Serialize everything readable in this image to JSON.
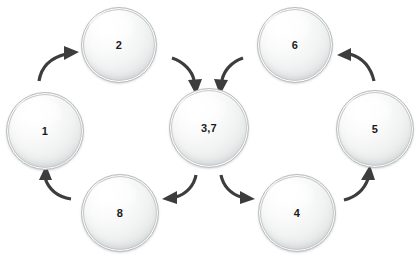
{
  "diagram": {
    "type": "cycle-flow",
    "background_color": "#ffffff",
    "node_fill_color": "#f0f1f1",
    "node_border_color": "#b9bcbd",
    "arrow_color": "#3d3d3d",
    "label_color": "#1b1b1b",
    "nodes": [
      {
        "id": "node-1",
        "label": "1",
        "cx": 45,
        "cy": 131,
        "r": 39
      },
      {
        "id": "node-2",
        "label": "2",
        "cx": 119,
        "cy": 45,
        "r": 38
      },
      {
        "id": "node-37",
        "label": "3,7",
        "cx": 209,
        "cy": 128,
        "r": 40
      },
      {
        "id": "node-6",
        "label": "6",
        "cx": 295,
        "cy": 45,
        "r": 38
      },
      {
        "id": "node-5",
        "label": "5",
        "cx": 375,
        "cy": 129,
        "r": 39
      },
      {
        "id": "node-4",
        "label": "4",
        "cx": 297,
        "cy": 213,
        "r": 39
      },
      {
        "id": "node-8",
        "label": "8",
        "cx": 120,
        "cy": 213,
        "r": 39
      }
    ],
    "arrows": [
      {
        "id": "arrow-1-to-2",
        "from": "1",
        "to": "2",
        "direction": "up-right"
      },
      {
        "id": "arrow-2-to-37",
        "from": "2",
        "to": "3,7",
        "direction": "down-right"
      },
      {
        "id": "arrow-6-to-37",
        "from": "6",
        "to": "3,7",
        "direction": "down-left"
      },
      {
        "id": "arrow-37-to-8",
        "from": "3,7",
        "to": "8",
        "direction": "down-left"
      },
      {
        "id": "arrow-37-to-4",
        "from": "3,7",
        "to": "4",
        "direction": "down-right"
      },
      {
        "id": "arrow-4-to-5",
        "from": "4",
        "to": "5",
        "direction": "up-right"
      },
      {
        "id": "arrow-5-to-6",
        "from": "5",
        "to": "6",
        "direction": "up-left"
      },
      {
        "id": "arrow-8-to-1",
        "from": "8",
        "to": "1",
        "direction": "up-left"
      }
    ]
  }
}
